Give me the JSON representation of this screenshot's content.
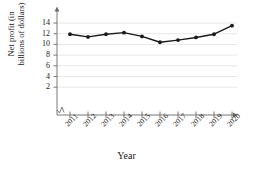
{
  "chart_data": {
    "type": "line",
    "title": "",
    "xlabel": "Year",
    "ylabel": "Net profit (in billions of dollars)",
    "ylabel_line1": "Net profit (in",
    "ylabel_line2": "billions of dollars)",
    "categories": [
      "2011",
      "2012",
      "2013",
      "2014",
      "2015",
      "2016",
      "2017",
      "2018",
      "2019",
      "2020"
    ],
    "values": [
      11.9,
      11.4,
      11.9,
      12.2,
      11.5,
      10.4,
      10.8,
      11.3,
      11.9,
      13.5
    ],
    "yticks": [
      2,
      4,
      6,
      8,
      10,
      12,
      14
    ],
    "ytick_labels": [
      "2",
      "4",
      "6",
      "8",
      "10",
      "12",
      "14"
    ],
    "ylim": [
      0,
      15
    ],
    "grid": true,
    "legend": "none",
    "axis_break": true,
    "marker": "filled-circle",
    "line_color": "#1a1a1a",
    "marker_color": "#1a1a1a",
    "grid_color": "#d8d8d8",
    "axis_color": "#6a6a6a",
    "background": "#ffffff"
  }
}
